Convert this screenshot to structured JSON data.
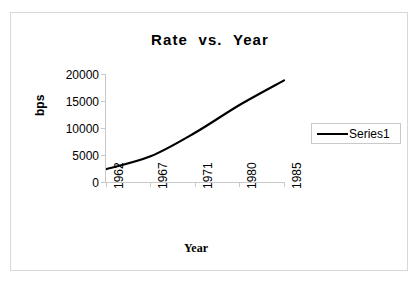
{
  "chart_data": {
    "type": "line",
    "title": "Rate  vs.  Year",
    "xlabel": "Year",
    "ylabel": "bps",
    "categories": [
      "1962",
      "1967",
      "1971",
      "1980",
      "1985"
    ],
    "x": [
      1962,
      1967,
      1971,
      1980,
      1985
    ],
    "series": [
      {
        "name": "Series1",
        "values": [
          2400,
          4800,
          9200,
          14400,
          19000
        ],
        "color": "#000000"
      }
    ],
    "ylim": [
      0,
      20000
    ],
    "yticks": [
      0,
      5000,
      10000,
      15000,
      20000
    ],
    "ytick_labels": [
      "0",
      "5000",
      "10000",
      "15000",
      "20000"
    ],
    "xtick_labels": [
      "1962",
      "1967",
      "1971",
      "1980",
      "1985"
    ],
    "grid": false,
    "legend_position": "right",
    "legend_entries": [
      "Series1"
    ],
    "xtick_label_rotation": "-90",
    "ylabel_rotation": "-90",
    "plot_border": "none",
    "frame_border_color": "#d8d8d8",
    "axis_color": "#c9c9c9"
  },
  "legend": {
    "series1_label": "Series1"
  },
  "axes": {
    "y_title": "bps",
    "x_title": "Year"
  }
}
